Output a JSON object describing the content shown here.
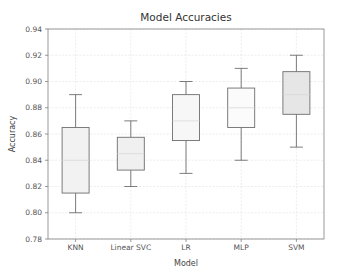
{
  "chart_data": {
    "type": "box",
    "title": "Model Accuracies",
    "xlabel": "Model",
    "ylabel": "Accuracy",
    "ylim": [
      0.78,
      0.94
    ],
    "yticks": [
      "0.78",
      "0.80",
      "0.82",
      "0.84",
      "0.86",
      "0.88",
      "0.90",
      "0.92",
      "0.94"
    ],
    "grid": true,
    "categories": [
      "KNN",
      "Linear SVC",
      "LR",
      "MLP",
      "SVM"
    ],
    "series": [
      {
        "name": "KNN",
        "whislo": 0.8,
        "q1": 0.815,
        "med": 0.84,
        "q3": 0.865,
        "whishi": 0.89,
        "fill": "#f2f2f2"
      },
      {
        "name": "Linear SVC",
        "whislo": 0.82,
        "q1": 0.8325,
        "med": 0.845,
        "q3": 0.8575,
        "whishi": 0.87,
        "fill": "#f0f0f0"
      },
      {
        "name": "LR",
        "whislo": 0.83,
        "q1": 0.855,
        "med": 0.87,
        "q3": 0.89,
        "whishi": 0.9,
        "fill": "#f7f7f7"
      },
      {
        "name": "MLP",
        "whislo": 0.84,
        "q1": 0.865,
        "med": 0.88,
        "q3": 0.895,
        "whishi": 0.91,
        "fill": "#fbfbfb"
      },
      {
        "name": "SVM",
        "whislo": 0.85,
        "q1": 0.875,
        "med": 0.89,
        "q3": 0.9075,
        "whishi": 0.92,
        "fill": "#e6e6e6"
      }
    ]
  },
  "colors": {
    "axis": "#808080",
    "grid": "#e0e0e0",
    "box_edge": "#6e6e6e",
    "median": "#d8d8d8"
  }
}
